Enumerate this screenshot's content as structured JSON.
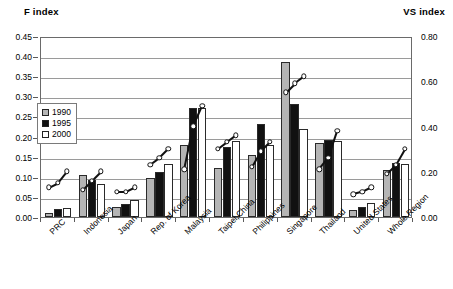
{
  "titles": {
    "left_axis": "F index",
    "right_axis": "VS index"
  },
  "legend": {
    "items": [
      {
        "label": "1990",
        "color": "#b5b5b5"
      },
      {
        "label": "1995",
        "color": "#111111"
      },
      {
        "label": "2000",
        "color": "#ffffff"
      }
    ]
  },
  "chart_data": {
    "type": "bar",
    "title": "",
    "subtitle": "",
    "xlabel": "",
    "ylabel": "F index",
    "y2label": "VS index",
    "ylim": [
      0.0,
      0.45
    ],
    "y2lim": [
      0.0,
      0.8
    ],
    "yticks": [
      "0.00",
      "0.05",
      "0.10",
      "0.15",
      "0.20",
      "0.25",
      "0.30",
      "0.35",
      "0.40",
      "0.45"
    ],
    "ytick_values": [
      0.0,
      0.05,
      0.1,
      0.15,
      0.2,
      0.25,
      0.3,
      0.35,
      0.4,
      0.45
    ],
    "y2ticks": [
      "0.00",
      "0.20",
      "0.40",
      "0.60",
      "0.80"
    ],
    "y2tick_values": [
      0.0,
      0.2,
      0.4,
      0.6,
      0.8
    ],
    "grid": true,
    "legend_position": "inside-left",
    "categories": [
      "PRC",
      "Indonesia",
      "Japan",
      "Rep. of Korea",
      "Malaysia",
      "Taipei,China",
      "Philippines",
      "Singapore",
      "Thailand",
      "United States",
      "Whole Region"
    ],
    "series": [
      {
        "name": "1990",
        "axis": "left",
        "kind": "bar",
        "color": "#b5b5b5",
        "values": [
          0.01,
          0.105,
          0.025,
          0.098,
          0.18,
          0.122,
          0.155,
          0.385,
          0.185,
          0.018,
          0.118
        ]
      },
      {
        "name": "1995",
        "axis": "left",
        "kind": "bar",
        "color": "#111111",
        "values": [
          0.02,
          0.092,
          0.032,
          0.113,
          0.27,
          0.175,
          0.232,
          0.28,
          0.192,
          0.026,
          0.135
        ]
      },
      {
        "name": "2000",
        "axis": "left",
        "kind": "bar",
        "color": "#ffffff",
        "values": [
          0.022,
          0.082,
          0.042,
          0.133,
          0.27,
          0.19,
          0.18,
          0.22,
          0.188,
          0.034,
          0.133
        ]
      },
      {
        "name": "VS index",
        "axis": "right",
        "kind": "scatter-line",
        "color": "#111111",
        "values_by_year": {
          "1990": [
            0.14,
            0.13,
            0.12,
            0.24,
            0.22,
            0.31,
            0.23,
            0.56,
            0.22,
            0.11,
            0.2
          ],
          "1995": [
            0.16,
            0.17,
            0.12,
            0.27,
            0.41,
            0.34,
            0.3,
            0.6,
            0.27,
            0.12,
            0.24
          ],
          "2000": [
            0.21,
            0.21,
            0.14,
            0.31,
            0.5,
            0.37,
            0.34,
            0.63,
            0.39,
            0.14,
            0.31
          ]
        }
      }
    ]
  }
}
